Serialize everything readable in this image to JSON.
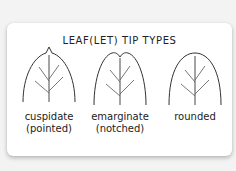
{
  "title": "LEAF(LET) TIP TYPES",
  "colors": {
    "background": "#f3f3f3",
    "card": "#ffffff",
    "stroke": "#333333",
    "text": "#222222"
  },
  "leaves": [
    {
      "name": "cuspidate",
      "line1": "cuspidate",
      "line2": "(pointed)",
      "tip": "pointed"
    },
    {
      "name": "emarginate",
      "line1": "emarginate",
      "line2": "(notched)",
      "tip": "notched"
    },
    {
      "name": "rounded",
      "line1": "rounded",
      "line2": "",
      "tip": "rounded"
    }
  ]
}
